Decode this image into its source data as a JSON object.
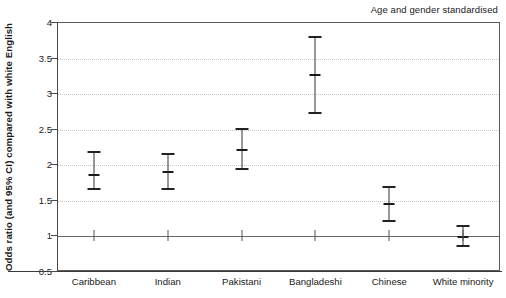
{
  "annotation": "Age and gender standardised",
  "axis": {
    "ylabel": "Odds ratio (and 95% CI) compared with white English",
    "yticks": [
      "0.5",
      "1",
      "1.5",
      "2",
      "2.5",
      "3",
      "3.5",
      "4"
    ]
  },
  "chart_data": {
    "type": "scatter",
    "title": "",
    "subtitle": "Age and gender standardised",
    "xlabel": "",
    "ylabel": "Odds ratio (and 95% CI) compared with white English",
    "categories": [
      "Caribbean",
      "Indian",
      "Pakistani",
      "Bangladeshi",
      "Chinese",
      "White minority"
    ],
    "values": [
      1.87,
      1.9,
      2.21,
      3.27,
      1.45,
      0.99
    ],
    "ci_lower": [
      1.66,
      1.67,
      1.95,
      2.73,
      1.22,
      0.86
    ],
    "ci_upper": [
      2.18,
      2.16,
      2.51,
      3.81,
      1.69,
      1.15
    ],
    "ylim": [
      0.5,
      4
    ],
    "ytick_values": [
      0.5,
      1,
      1.5,
      2,
      2.5,
      3,
      3.5,
      4
    ],
    "reference_line": 1,
    "grid": true,
    "grid_style": "dotted-horizontal",
    "legend": "none",
    "error_bar_type": "95% confidence interval",
    "colors": {
      "marker": "#1a1a1a",
      "errorbar": "#333333",
      "gridline": "#c8c8c8",
      "reference": "#666666",
      "axis": "#4a4a4a",
      "background": "#ffffff"
    }
  }
}
